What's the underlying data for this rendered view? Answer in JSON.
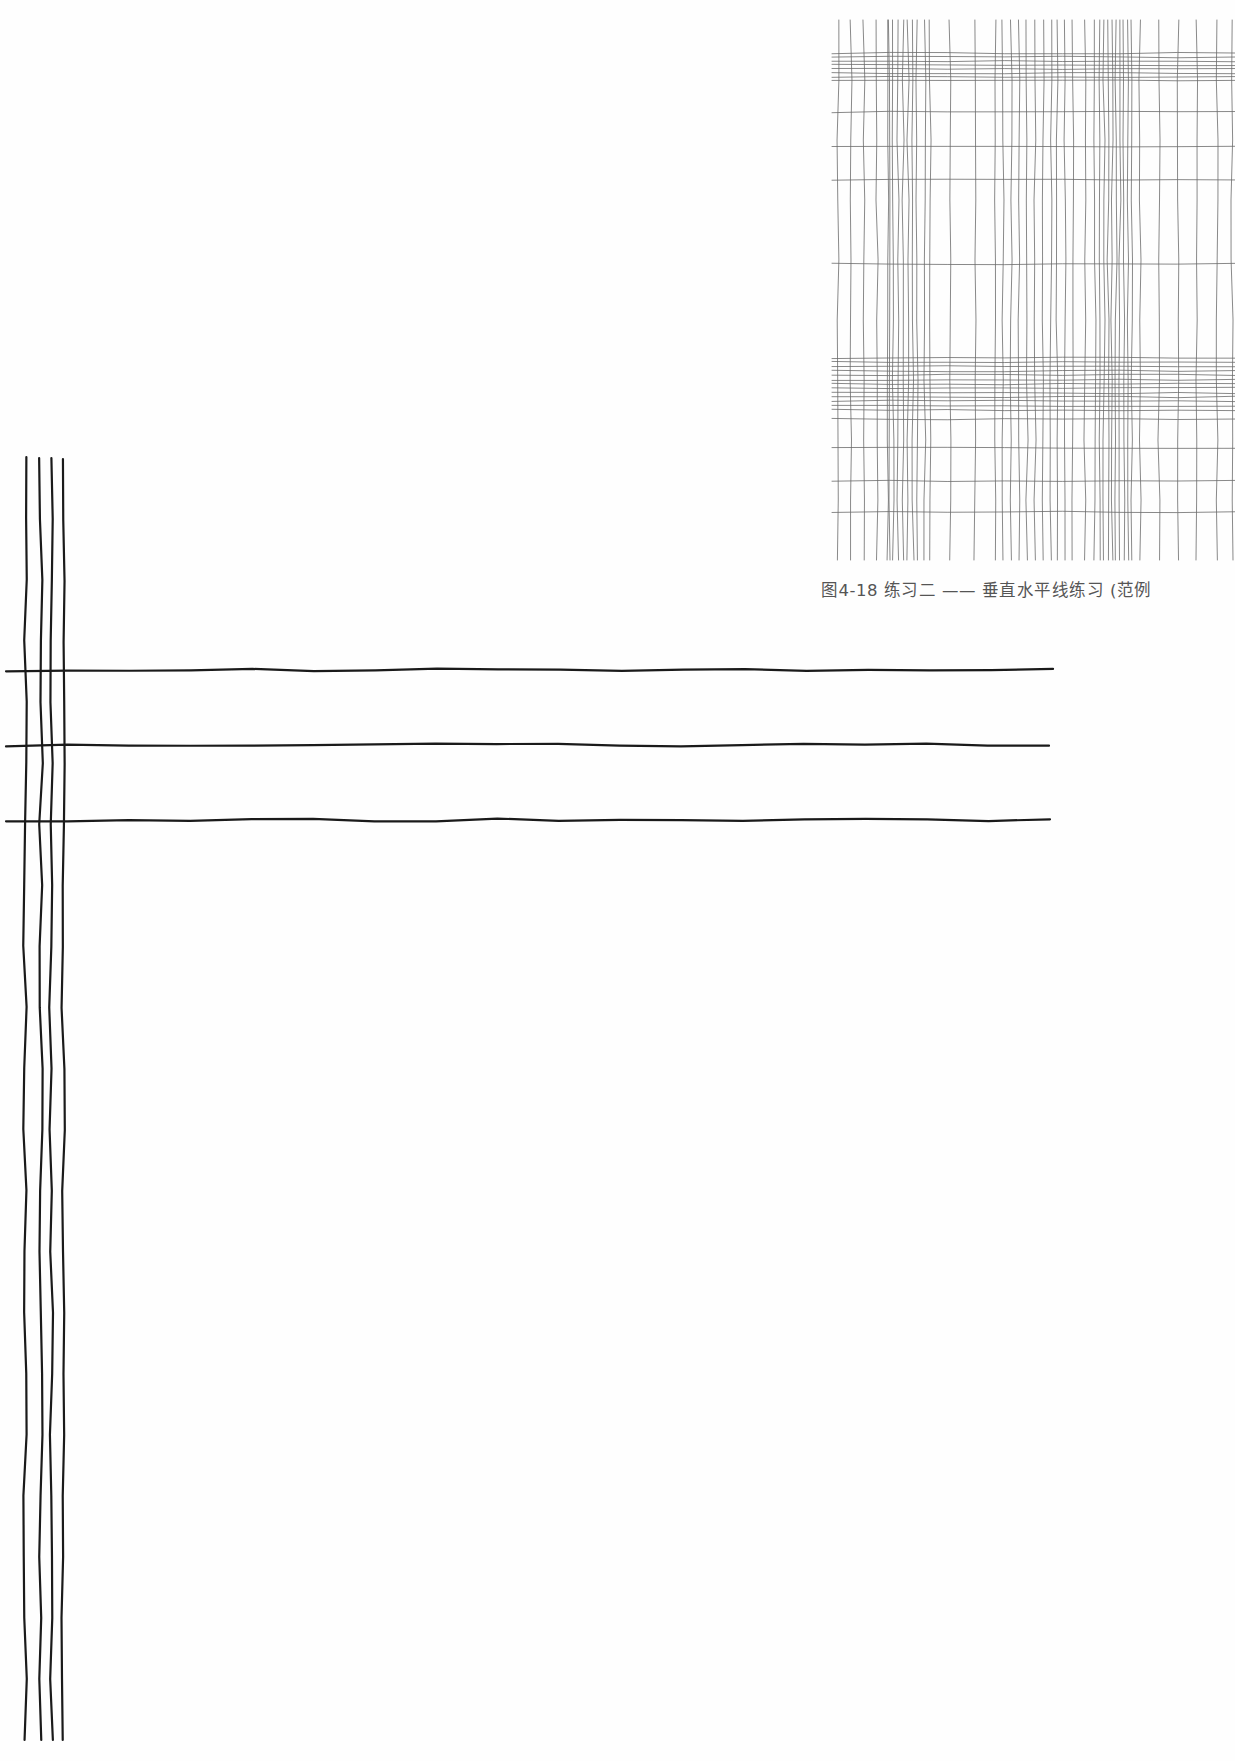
{
  "page": {
    "background": "#fefefe"
  },
  "figure": {
    "caption": "图4-18  练习二 —— 垂直水平线练习 (范例",
    "label": "图4-18",
    "title": "练习二 —— 垂直水平线练习 (范例",
    "line_color": "#6b6b6b",
    "grid": {
      "x_start": 832,
      "x_end": 1235,
      "y_start": 20,
      "y_end": 560,
      "vertical_lines_x": [
        838,
        851,
        864,
        877,
        888,
        889,
        893,
        898,
        903,
        908,
        913,
        917,
        925,
        930,
        950,
        975,
        995,
        1003,
        1011,
        1019,
        1027,
        1035,
        1043,
        1051,
        1057,
        1065,
        1073,
        1085,
        1095,
        1100,
        1104,
        1108,
        1112,
        1116,
        1120,
        1124,
        1128,
        1132,
        1140,
        1159,
        1178,
        1197,
        1217,
        1232
      ],
      "horizontal_lines_y": [
        53,
        57,
        61,
        65,
        69,
        73,
        77,
        80,
        112,
        147,
        180,
        264,
        358,
        362,
        366,
        371,
        375,
        380,
        384,
        388,
        393,
        397,
        401,
        406,
        410,
        419,
        448,
        481,
        512
      ]
    }
  },
  "practice": {
    "line_color": "#1a1a1a",
    "vertical_lines": [
      {
        "x": 25,
        "y_top": 457,
        "y_bottom": 1740
      },
      {
        "x": 41,
        "y_top": 458,
        "y_bottom": 1740
      },
      {
        "x": 51,
        "y_top": 458,
        "y_bottom": 1740
      },
      {
        "x": 63,
        "y_top": 459,
        "y_bottom": 1740
      }
    ],
    "horizontal_lines": [
      {
        "y": 670,
        "x_left": 6,
        "x_right": 1053
      },
      {
        "y": 745,
        "x_left": 6,
        "x_right": 1049
      },
      {
        "y": 820,
        "x_left": 6,
        "x_right": 1050
      }
    ]
  }
}
